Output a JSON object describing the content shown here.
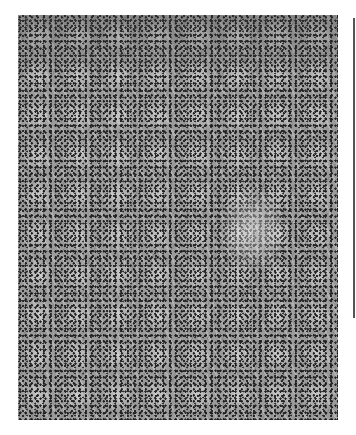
{
  "image": {
    "subject": "histology-micrograph",
    "description": "Grayscale light micrograph of tissue with densely packed cells and dark nuclei",
    "palette": {
      "background": "#ffffff",
      "tissue": "#9a9a9a",
      "nuclei": "#1e1e1e",
      "edge_rule": "#555555"
    }
  }
}
